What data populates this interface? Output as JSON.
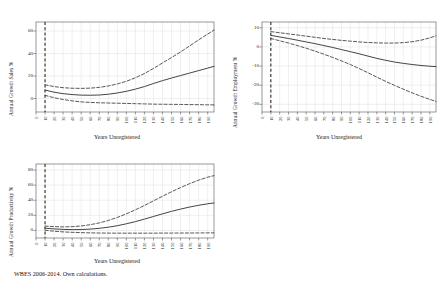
{
  "figure": {
    "footnote": "WBES 2006-2014. Own calculations.",
    "background": "#ffffff",
    "line_color": "#3a3a3a",
    "grid_color": "#d8d8d8",
    "axis_color": "#555555",
    "vline_color": "#2b2b2b"
  },
  "xtick_labels": [
    "0",
    "10",
    "20",
    "30",
    "40",
    "50",
    "60",
    "70",
    "80",
    "90",
    "100",
    "110",
    "120",
    "130",
    "140",
    "150",
    "160",
    "170",
    "180",
    "190"
  ],
  "chart_data": [
    {
      "id": "sales",
      "type": "line",
      "title": "",
      "ylabel": "Annual Growth Sales %",
      "xlabel": "Years Unregistered",
      "ylim": [
        -12,
        68
      ],
      "xlim": [
        0,
        197
      ],
      "yticks": [
        0,
        20,
        40,
        60
      ],
      "xticks": [
        0,
        10,
        20,
        30,
        40,
        50,
        60,
        70,
        80,
        90,
        100,
        110,
        120,
        130,
        140,
        150,
        160,
        170,
        180,
        190
      ],
      "grid": true,
      "legend": "none",
      "vline_x": 10,
      "x": [
        10,
        20,
        30,
        40,
        50,
        60,
        70,
        80,
        90,
        100,
        110,
        120,
        130,
        140,
        150,
        160,
        170,
        180,
        190,
        197
      ],
      "series": [
        {
          "name": "Predicted margin",
          "style": "solid",
          "values": [
            7.5,
            5.6,
            4.3,
            3.5,
            3.0,
            2.9,
            3.1,
            3.8,
            4.9,
            6.4,
            8.3,
            10.6,
            13.3,
            15.9,
            18.2,
            20.4,
            22.6,
            24.8,
            27.0,
            28.6
          ]
        },
        {
          "name": "Upper 95% CI",
          "style": "dashed",
          "values": [
            12.2,
            10.6,
            9.6,
            9.1,
            9.0,
            9.2,
            9.9,
            11.1,
            12.9,
            15.3,
            18.4,
            22.2,
            26.7,
            31.6,
            36.4,
            41.4,
            46.7,
            52.1,
            57.3,
            60.8
          ]
        },
        {
          "name": "Lower 95% CI",
          "style": "dashed",
          "values": [
            2.8,
            0.7,
            -0.9,
            -2.1,
            -3.0,
            -3.5,
            -3.8,
            -4.0,
            -4.2,
            -4.4,
            -4.6,
            -4.8,
            -5.0,
            -5.1,
            -5.2,
            -5.3,
            -5.4,
            -5.5,
            -5.6,
            -5.7
          ]
        }
      ]
    },
    {
      "id": "employment",
      "type": "line",
      "title": "",
      "ylabel": "Annual Growth Employment %",
      "xlabel": "Years Unregistered",
      "ylim": [
        -34,
        13
      ],
      "xlim": [
        0,
        197
      ],
      "yticks": [
        10,
        0,
        -10,
        -20,
        -30
      ],
      "xticks": [
        0,
        10,
        20,
        30,
        40,
        50,
        60,
        70,
        80,
        90,
        100,
        110,
        120,
        130,
        140,
        150,
        160,
        170,
        180,
        190
      ],
      "grid": true,
      "legend": "none",
      "vline_x": 10,
      "x": [
        10,
        20,
        30,
        40,
        50,
        60,
        70,
        80,
        90,
        100,
        110,
        120,
        130,
        140,
        150,
        160,
        170,
        180,
        190,
        197
      ],
      "series": [
        {
          "name": "Predicted margin",
          "style": "solid",
          "values": [
            6.0,
            5.2,
            4.4,
            3.5,
            2.6,
            1.7,
            0.7,
            -0.3,
            -1.4,
            -2.5,
            -3.6,
            -4.8,
            -6.0,
            -7.0,
            -7.9,
            -8.6,
            -9.2,
            -9.7,
            -10.1,
            -10.3
          ]
        },
        {
          "name": "Upper 95% CI",
          "style": "dashed",
          "values": [
            8.0,
            7.4,
            6.8,
            6.2,
            5.6,
            5.0,
            4.4,
            3.9,
            3.4,
            3.0,
            2.6,
            2.3,
            2.1,
            2.0,
            2.0,
            2.2,
            2.7,
            3.5,
            4.7,
            5.8
          ]
        },
        {
          "name": "Lower 95% CI",
          "style": "dashed",
          "values": [
            4.4,
            3.2,
            2.0,
            0.7,
            -0.7,
            -2.2,
            -3.8,
            -5.5,
            -7.3,
            -9.2,
            -11.3,
            -13.5,
            -15.8,
            -18.0,
            -20.1,
            -22.1,
            -24.0,
            -25.8,
            -27.4,
            -28.5
          ]
        }
      ]
    },
    {
      "id": "productivity",
      "type": "line",
      "title": "",
      "ylabel": "Annual Growth Productivity %",
      "xlabel": "Years Unregistered",
      "ylim": [
        -10,
        88
      ],
      "xlim": [
        0,
        197
      ],
      "yticks": [
        0,
        20,
        40,
        60,
        80
      ],
      "xticks": [
        0,
        10,
        20,
        30,
        40,
        50,
        60,
        70,
        80,
        90,
        100,
        110,
        120,
        130,
        140,
        150,
        160,
        170,
        180,
        190
      ],
      "grid": true,
      "legend": "none",
      "vline_x": 10,
      "x": [
        10,
        20,
        30,
        40,
        50,
        60,
        70,
        80,
        90,
        100,
        110,
        120,
        130,
        140,
        150,
        160,
        170,
        180,
        190,
        197
      ],
      "series": [
        {
          "name": "Predicted margin",
          "style": "solid",
          "values": [
            3.0,
            2.0,
            1.4,
            1.1,
            1.2,
            1.8,
            2.8,
            4.3,
            6.3,
            8.8,
            11.7,
            15.0,
            18.5,
            22.0,
            25.3,
            28.3,
            31.0,
            33.3,
            35.3,
            36.4
          ]
        },
        {
          "name": "Upper 95% CI",
          "style": "dashed",
          "values": [
            5.8,
            5.0,
            4.7,
            5.0,
            5.9,
            7.6,
            10.0,
            13.2,
            17.2,
            22.0,
            27.3,
            33.1,
            39.2,
            45.3,
            51.2,
            56.8,
            62.0,
            66.6,
            70.5,
            72.6
          ]
        },
        {
          "name": "Lower 95% CI",
          "style": "dashed",
          "values": [
            0.2,
            -1.0,
            -1.9,
            -2.5,
            -2.9,
            -3.2,
            -3.4,
            -3.5,
            -3.6,
            -3.6,
            -3.6,
            -3.6,
            -3.6,
            -3.5,
            -3.5,
            -3.4,
            -3.4,
            -3.3,
            -3.2,
            -3.2
          ]
        }
      ]
    }
  ]
}
